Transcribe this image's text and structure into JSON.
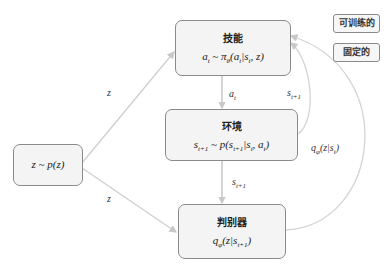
{
  "diagram": {
    "nodes": {
      "prior": {
        "formula": "z ~ p(z)"
      },
      "skill": {
        "title": "技能",
        "formula": "a_t ~ π_θ(a_t|s_t, z)"
      },
      "environment": {
        "title": "环境",
        "formula": "s_{t+1} ~ p(s_{t+1}|s_t, a_t)"
      },
      "discriminator": {
        "title": "判别器",
        "formula": "q_φ(z|s_{t+1})"
      }
    },
    "edges": [
      {
        "from": "prior",
        "to": "skill",
        "label": "z"
      },
      {
        "from": "prior",
        "to": "discriminator",
        "label": "z"
      },
      {
        "from": "skill",
        "to": "environment",
        "label": "a_t"
      },
      {
        "from": "environment",
        "to": "discriminator",
        "label": "s_{t+1}"
      },
      {
        "from": "environment",
        "to": "skill",
        "label": "s_{t+1}"
      },
      {
        "from": "discriminator",
        "to": "skill",
        "label": "q_φ(z|s_t)"
      }
    ],
    "legend": [
      {
        "label": "可训练的"
      },
      {
        "label": "固定的"
      }
    ]
  }
}
